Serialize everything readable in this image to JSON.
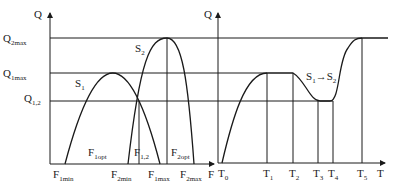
{
  "left_chart": {
    "y_axis_label": "Q",
    "x_axis_label": "F",
    "levels": [
      {
        "base": "Q",
        "sub": "2max"
      },
      {
        "base": "Q",
        "sub": "1max"
      },
      {
        "base": "Q",
        "sub": "1,2"
      }
    ],
    "curves": [
      {
        "base": "S",
        "sub": "1"
      },
      {
        "base": "S",
        "sub": "2"
      }
    ],
    "inner_labels": [
      {
        "base": "F",
        "sub": "1opt"
      },
      {
        "base": "F",
        "sub": "1,2"
      },
      {
        "base": "F",
        "sub": "2opt"
      }
    ],
    "x_ticks": [
      {
        "base": "F",
        "sub": "1min"
      },
      {
        "base": "F",
        "sub": "2min"
      },
      {
        "base": "F",
        "sub": "1max"
      },
      {
        "base": "F",
        "sub": "2max"
      }
    ]
  },
  "right_chart": {
    "y_axis_label": "Q",
    "x_axis_label": "T",
    "transition_label": {
      "s1": "S",
      "s1_sub": "1",
      "arrow": "→",
      "s2": "S",
      "s2_sub": "2"
    },
    "x_ticks": [
      {
        "base": "T",
        "sub": "0"
      },
      {
        "base": "T",
        "sub": "1"
      },
      {
        "base": "T",
        "sub": "2"
      },
      {
        "base": "T",
        "sub": "3"
      },
      {
        "base": "T",
        "sub": "4"
      },
      {
        "base": "T",
        "sub": "5"
      }
    ]
  },
  "colors": {
    "line": "#1a1a1a",
    "background": "#ffffff"
  }
}
